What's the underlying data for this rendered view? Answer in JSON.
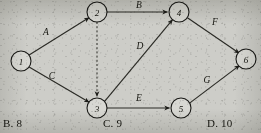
{
  "diagram": {
    "type": "directed-graph",
    "title": "",
    "nodes": [
      {
        "id": "1",
        "label": "1",
        "x": 21,
        "y": 61,
        "r": 10
      },
      {
        "id": "2",
        "label": "2",
        "x": 97,
        "y": 12,
        "r": 10
      },
      {
        "id": "3",
        "label": "3",
        "x": 97,
        "y": 108,
        "r": 10
      },
      {
        "id": "4",
        "label": "4",
        "x": 179,
        "y": 12,
        "r": 10
      },
      {
        "id": "5",
        "label": "5",
        "x": 181,
        "y": 108,
        "r": 10
      },
      {
        "id": "6",
        "label": "6",
        "x": 246,
        "y": 59,
        "r": 10
      }
    ],
    "edges": [
      {
        "id": "A",
        "label": "A",
        "from": "1",
        "to": "2",
        "style": "solid",
        "label_x": 46,
        "label_y": 32
      },
      {
        "id": "C",
        "label": "C",
        "from": "1",
        "to": "3",
        "style": "solid",
        "label_x": 52,
        "label_y": 76
      },
      {
        "id": "B",
        "label": "B",
        "from": "2",
        "to": "4",
        "style": "solid",
        "label_x": 139,
        "label_y": 5
      },
      {
        "id": "dummy",
        "label": "",
        "from": "2",
        "to": "3",
        "style": "dashed",
        "label_x": 0,
        "label_y": 0
      },
      {
        "id": "D",
        "label": "D",
        "from": "3",
        "to": "4",
        "style": "solid",
        "label_x": 140,
        "label_y": 46
      },
      {
        "id": "E",
        "label": "E",
        "from": "3",
        "to": "5",
        "style": "solid",
        "label_x": 139,
        "label_y": 98
      },
      {
        "id": "F",
        "label": "F",
        "from": "4",
        "to": "6",
        "style": "solid",
        "label_x": 215,
        "label_y": 22
      },
      {
        "id": "G",
        "label": "G",
        "from": "5",
        "to": "6",
        "style": "solid",
        "label_x": 207,
        "label_y": 80
      }
    ]
  },
  "options": [
    {
      "id": "B",
      "text": "B. 8",
      "x": 3,
      "y": 117
    },
    {
      "id": "C",
      "text": "C. 9",
      "x": 103,
      "y": 117
    },
    {
      "id": "D",
      "text": "D. 10",
      "x": 207,
      "y": 117
    }
  ]
}
